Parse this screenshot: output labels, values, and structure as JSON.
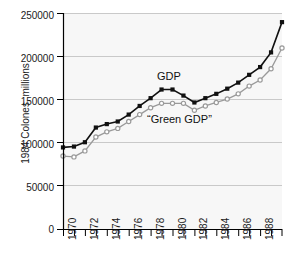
{
  "figure": {
    "background_color": "#ffffff",
    "plot_background_color": "#f7f7f7",
    "gridline_color": "#c9c9c9",
    "axis_color": "#000000"
  },
  "axes": {
    "ylabel": "1984 Colones, millions",
    "ytick_labels": [
      "0",
      "50000",
      "100000",
      "150000",
      "200000",
      "250000"
    ],
    "xtick_labels": [
      "1970",
      "1972",
      "1974",
      "1976",
      "1978",
      "1980",
      "1982",
      "1984",
      "1986",
      "1988"
    ]
  },
  "annotations": {
    "gdp_label": "GDP",
    "green_gdp_label": "“Green GDP”"
  },
  "chart_data": {
    "type": "line",
    "title": "",
    "xlabel": "",
    "ylabel": "1984 Colones, millions",
    "xlim": [
      1970,
      1990
    ],
    "ylim": [
      0,
      250000
    ],
    "xticks": [
      1970,
      1972,
      1974,
      1976,
      1978,
      1980,
      1982,
      1984,
      1986,
      1988
    ],
    "xtick_labels": [
      "1970",
      "1972",
      "1974",
      "1976",
      "1978",
      "1980",
      "1982",
      "1984",
      "1986",
      "1988"
    ],
    "yticks": [
      0,
      50000,
      100000,
      150000,
      200000,
      250000
    ],
    "ytick_labels": [
      "0",
      "50000",
      "100000",
      "150000",
      "200000",
      "250000"
    ],
    "minor_xticks_every": 1,
    "grid": "horizontal",
    "legend": "inline-annotations",
    "x": [
      1970,
      1971,
      1972,
      1973,
      1974,
      1975,
      1976,
      1977,
      1978,
      1979,
      1980,
      1981,
      1982,
      1983,
      1984,
      1985,
      1986,
      1987,
      1988,
      1989,
      1990
    ],
    "series": [
      {
        "name": "GDP",
        "color": "#111111",
        "marker": "filled-square",
        "values": [
          95000,
          96000,
          101000,
          118000,
          122000,
          125000,
          133000,
          143000,
          152000,
          162000,
          162000,
          155000,
          147000,
          152000,
          157000,
          163000,
          170000,
          179000,
          188000,
          205000,
          240000
        ]
      },
      {
        "name": "“Green GDP”",
        "color": "#9a9a9a",
        "marker": "open-circle",
        "values": [
          85000,
          84000,
          91000,
          107000,
          113000,
          117000,
          125000,
          133000,
          141000,
          146000,
          146000,
          146000,
          138000,
          143000,
          147000,
          151000,
          157000,
          166000,
          173000,
          186000,
          210000
        ]
      }
    ]
  }
}
